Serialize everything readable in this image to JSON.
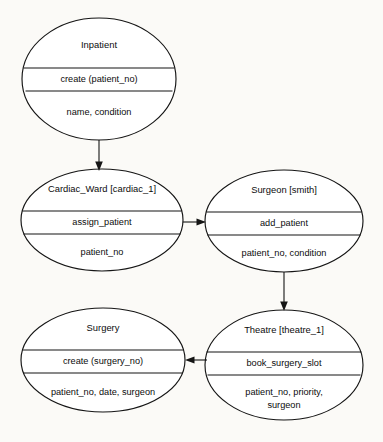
{
  "diagram": {
    "background_color": "#fbfaf7",
    "stroke_color": "#151515",
    "fill_color": "#ffffff",
    "nodes": [
      {
        "id": "inpatient",
        "name": "Inpatient",
        "operation": "create (patient_no)",
        "attributes": "name, condition",
        "attributes_line2": "",
        "cx": 99,
        "cy": 79,
        "rx": 77,
        "ry": 61,
        "divider_top_y": 68,
        "divider_bottom_y": 91
      },
      {
        "id": "cardiac-ward",
        "name": "Cardiac_Ward [cardiac_1]",
        "operation": "assign_patient",
        "attributes": "patient_no",
        "attributes_line2": "",
        "cx": 102,
        "cy": 220,
        "rx": 81,
        "ry": 51,
        "divider_top_y": 211,
        "divider_bottom_y": 234
      },
      {
        "id": "surgeon",
        "name": "Surgeon [smith]",
        "operation": "add_patient",
        "attributes": "patient_no, condition",
        "attributes_line2": "",
        "cx": 284,
        "cy": 221,
        "rx": 79,
        "ry": 51,
        "divider_top_y": 212,
        "divider_bottom_y": 235
      },
      {
        "id": "surgery",
        "name": "Surgery",
        "operation": "create (surgery_no)",
        "attributes": "patient_no, date, surgeon",
        "attributes_line2": "",
        "cx": 103,
        "cy": 360,
        "rx": 82,
        "ry": 52,
        "divider_top_y": 350,
        "divider_bottom_y": 373
      },
      {
        "id": "theatre",
        "name": "Theatre [theatre_1]",
        "operation": "book_surgery_slot",
        "attributes": "patient_no, priority,",
        "attributes_line2": "surgeon",
        "cx": 284,
        "cy": 365,
        "rx": 79,
        "ry": 55,
        "divider_top_y": 352,
        "divider_bottom_y": 375
      }
    ],
    "connectors": [
      {
        "id": "inpatient-to-cardiac-ward",
        "from": "inpatient",
        "to": "cardiac-ward",
        "direction": "down",
        "x1": 99,
        "y1": 140,
        "x2": 99,
        "y2": 170
      },
      {
        "id": "cardiac-ward-to-surgeon",
        "from": "cardiac-ward",
        "to": "surgeon",
        "direction": "right",
        "x1": 183,
        "y1": 222,
        "x2": 205,
        "y2": 222
      },
      {
        "id": "surgeon-to-theatre",
        "from": "surgeon",
        "to": "theatre",
        "direction": "down",
        "x1": 284,
        "y1": 272,
        "x2": 284,
        "y2": 310
      },
      {
        "id": "theatre-to-surgery",
        "from": "theatre",
        "to": "surgery",
        "direction": "left",
        "x1": 207,
        "y1": 360,
        "x2": 186,
        "y2": 360
      }
    ]
  }
}
